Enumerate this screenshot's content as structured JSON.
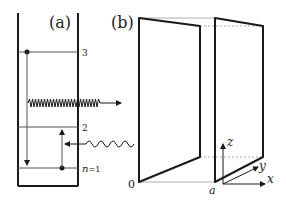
{
  "panel_a": {
    "label": "(a)",
    "levels": [
      {
        "name": "level-3",
        "label": "3"
      },
      {
        "name": "level-2",
        "label": "2"
      },
      {
        "name": "level-1",
        "label_n": "n",
        "label_eq": "=1"
      }
    ],
    "emitted_photon": "wavy-arrow-outgoing",
    "absorbed_photon": "wavy-arrow-incoming"
  },
  "panel_b": {
    "label": "(b)",
    "origin_label": "0",
    "separation_label": "a",
    "axes": {
      "x": "x",
      "y": "y",
      "z": "z"
    }
  },
  "colors": {
    "line": "#1a1a1a",
    "thin_line": "#555555",
    "dashed": "#999999"
  }
}
